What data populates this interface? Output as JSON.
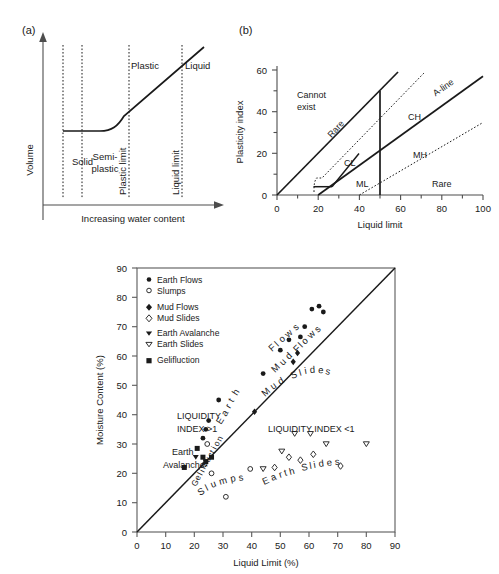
{
  "figure": {
    "panel_a_tag": "(a)",
    "panel_b_tag": "(b)",
    "background": "#ffffff",
    "ink": "#1a1a1a"
  },
  "panel_a": {
    "title": "(a)",
    "ylabel": "Volume",
    "xlabel": "Increasing water content",
    "zones": [
      {
        "label": "Solid"
      },
      {
        "label": "Semi-\nplastic",
        "line1": "Semi-",
        "line2": "plastic"
      },
      {
        "label": "Plastic"
      },
      {
        "label": "Liquid"
      }
    ],
    "limits": [
      {
        "label": "Plastic limit"
      },
      {
        "label": "Liquid limit"
      }
    ],
    "zone_top_labels": [
      "Plastic",
      "Liquid"
    ],
    "zone_bottom_labels": [
      "Solid",
      "Semi-",
      "plastic"
    ]
  },
  "panel_b": {
    "title": "(b)",
    "xlabel": "Liquid limit",
    "ylabel": "Plasticity index",
    "x_ticks_labeled": [
      0,
      20,
      40,
      60,
      80,
      100
    ],
    "x_ticks_minor": [
      10,
      30,
      50,
      70,
      90
    ],
    "y_ticks_labeled": [
      0,
      20,
      40,
      60
    ],
    "y_ticks_minor": [
      10,
      30,
      50
    ],
    "xlim": [
      0,
      100
    ],
    "ylim": [
      0,
      62
    ],
    "regions": [
      {
        "name": "Cannot exist",
        "line1": "Cannot",
        "line2": "exist"
      },
      {
        "name": "Rare",
        "label": "Rare"
      },
      {
        "name": "CL",
        "label": "CL"
      },
      {
        "name": "ML",
        "label": "ML"
      },
      {
        "name": "CH",
        "label": "CH"
      },
      {
        "name": "MH",
        "label": "MH"
      },
      {
        "name": "A-line",
        "label": "A-line"
      },
      {
        "name": "Rare-lower",
        "label": "Rare"
      }
    ],
    "u_line": {
      "label": "U-line",
      "from": [
        8,
        0
      ],
      "to": [
        59.5,
        59
      ]
    },
    "a_line": {
      "label": "A-line",
      "from": [
        20,
        0
      ],
      "to": [
        100,
        57
      ]
    },
    "vertical_divider_x": 50
  },
  "chart_data": {
    "type": "scatter",
    "title": "",
    "xlabel": "Liquid Limit (%)",
    "ylabel": "Moisture Content (%)",
    "xlim": [
      0,
      90
    ],
    "ylim": [
      0,
      90
    ],
    "x_ticks": [
      0,
      10,
      20,
      30,
      40,
      50,
      60,
      70,
      80,
      90
    ],
    "y_ticks": [
      0,
      10,
      20,
      30,
      40,
      50,
      60,
      70,
      80,
      90
    ],
    "grid": false,
    "legend_position": "top-left-inside",
    "reference_line": {
      "label": "Liquidity index = 1",
      "from": [
        0,
        0
      ],
      "to": [
        90,
        90
      ]
    },
    "annotations": [
      {
        "text": "LIQUIDITY",
        "x": 14,
        "y": 42
      },
      {
        "text": "INDEX >1",
        "x": 14,
        "y": 38.5
      },
      {
        "text": "LIQUIDITY INDEX <1",
        "x": 46,
        "y": 38.5
      },
      {
        "text": "Earth",
        "x": 12,
        "y": 31
      },
      {
        "text": "Avalanche",
        "x": 10,
        "y": 27.5
      }
    ],
    "curved_labels": [
      {
        "text": "Earth",
        "anchor": [
          27,
          46
        ]
      },
      {
        "text": "Flows",
        "anchor": [
          52,
          63
        ]
      },
      {
        "text": "Mud Flows",
        "anchor": [
          55,
          57
        ]
      },
      {
        "text": "Mud Slides",
        "anchor": [
          52,
          27
        ]
      },
      {
        "text": "Slumps",
        "anchor": [
          29,
          18
        ]
      },
      {
        "text": "Earth Slides",
        "anchor": [
          58,
          28
        ]
      },
      {
        "text": "Gelifluction",
        "anchor": [
          22,
          25
        ]
      }
    ],
    "series": [
      {
        "name": "Earth Flows",
        "marker": "filled-circle",
        "points": [
          [
            28.5,
            45.0
          ],
          [
            25.0,
            38.0
          ],
          [
            24.0,
            35.0
          ],
          [
            23.0,
            32.0
          ],
          [
            44.0,
            54.0
          ],
          [
            50.0,
            62.0
          ],
          [
            53.0,
            65.5
          ],
          [
            57.0,
            66.5
          ],
          [
            61.0,
            76.0
          ],
          [
            63.5,
            77.0
          ],
          [
            65.0,
            75.0
          ],
          [
            58.5,
            70.0
          ]
        ]
      },
      {
        "name": "Slumps",
        "marker": "open-circle",
        "points": [
          [
            23.5,
            23.0
          ],
          [
            26.0,
            20.0
          ],
          [
            31.0,
            12.0
          ],
          [
            39.5,
            21.5
          ],
          [
            24.5,
            30.0
          ]
        ]
      },
      {
        "name": "Mud Flows",
        "marker": "filled-diamond",
        "points": [
          [
            41.0,
            41.0
          ],
          [
            54.5,
            58.0
          ],
          [
            56.0,
            61.0
          ]
        ]
      },
      {
        "name": "Mud Slides",
        "marker": "open-diamond",
        "points": [
          [
            48.0,
            22.0
          ],
          [
            57.0,
            24.5
          ],
          [
            61.5,
            26.5
          ],
          [
            71.0,
            22.5
          ],
          [
            53.0,
            25.5
          ]
        ]
      },
      {
        "name": "Earth Avalanche",
        "marker": "filled-triangle-down",
        "points": [
          [
            20.5,
            25.5
          ],
          [
            24.0,
            24.0
          ]
        ]
      },
      {
        "name": "Earth Slides",
        "marker": "open-triangle-down",
        "points": [
          [
            44.0,
            21.5
          ],
          [
            50.5,
            27.5
          ],
          [
            55.0,
            33.5
          ],
          [
            60.5,
            33.5
          ],
          [
            80.0,
            30.0
          ],
          [
            66.0,
            30.0
          ]
        ]
      },
      {
        "name": "Gelifluction",
        "marker": "filled-square",
        "points": [
          [
            16.5,
            22.0
          ],
          [
            21.0,
            28.5
          ],
          [
            23.0,
            25.5
          ],
          [
            24.0,
            24.0
          ],
          [
            26.0,
            25.5
          ]
        ]
      }
    ],
    "legend_entries": [
      {
        "label": "Earth Flows",
        "marker": "filled-circle"
      },
      {
        "label": "Slumps",
        "marker": "open-circle"
      },
      {
        "label": "Mud Flows",
        "marker": "filled-diamond"
      },
      {
        "label": "Mud Slides",
        "marker": "open-diamond"
      },
      {
        "label": "Earth Avalanche",
        "marker": "filled-triangle-down"
      },
      {
        "label": "Earth Slides",
        "marker": "open-triangle-down"
      },
      {
        "label": "Gelifluction",
        "marker": "filled-square"
      }
    ]
  }
}
